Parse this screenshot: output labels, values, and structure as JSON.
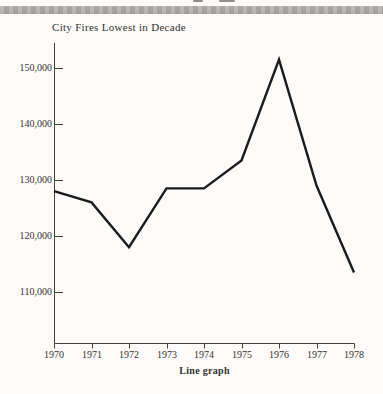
{
  "colors": {
    "background": "#fcfbf9",
    "band": "#adacaa",
    "line": "#1b1b1b",
    "axis": "#44413e",
    "text": "#35322f"
  },
  "chart_data": {
    "type": "line",
    "title": "City Fires Lowest in Decade",
    "caption": "Line graph",
    "xlabel": "",
    "ylabel": "",
    "categories": [
      "1970",
      "1971",
      "1972",
      "1973",
      "1974",
      "1975",
      "1976",
      "1977",
      "1978"
    ],
    "values": [
      128000,
      126000,
      118000,
      128500,
      128500,
      133500,
      151500,
      129000,
      113500
    ],
    "yticks": [
      {
        "value": 150000,
        "label": "150,000"
      },
      {
        "value": 140000,
        "label": "140,000"
      },
      {
        "value": 130000,
        "label": "130,000"
      },
      {
        "value": 120000,
        "label": "120,000"
      },
      {
        "value": 110000,
        "label": "110,000"
      }
    ],
    "ylim": [
      101000,
      154500
    ],
    "grid": false,
    "legend": "none"
  }
}
